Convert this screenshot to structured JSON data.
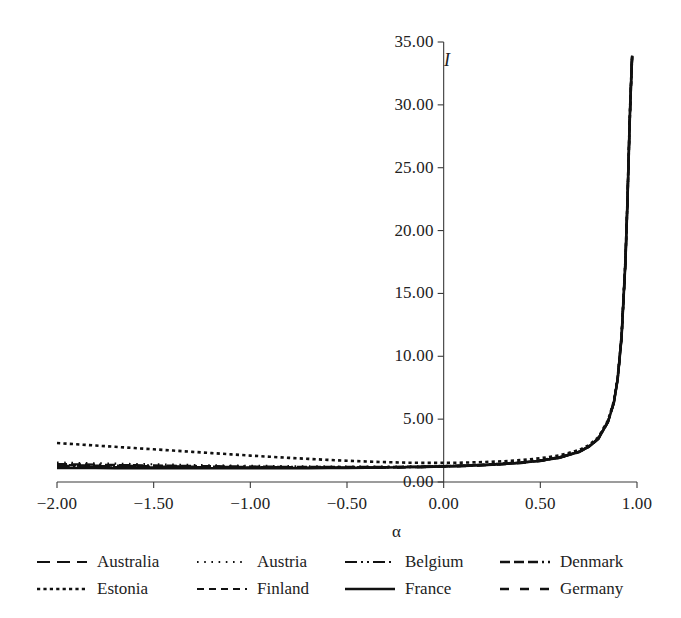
{
  "chart_data": {
    "type": "line",
    "title": "",
    "subtitle": "",
    "xlabel": "α",
    "ylabel": "I",
    "xlim": [
      -2.0,
      1.0
    ],
    "ylim": [
      0.0,
      35.0
    ],
    "grid": false,
    "legend_position": "bottom",
    "legend_columns": 4,
    "xticks": [
      "-2.00",
      "-1.50",
      "-1.00",
      "-0.50",
      "0.00",
      "0.50",
      "1.00"
    ],
    "xtick_values": [
      -2.0,
      -1.5,
      -1.0,
      -0.5,
      0.0,
      0.5,
      1.0
    ],
    "yticks": [
      "0.00",
      "5.00",
      "10.00",
      "15.00",
      "20.00",
      "25.00",
      "30.00",
      "35.00"
    ],
    "ytick_values": [
      0,
      5,
      10,
      15,
      20,
      25,
      30,
      35
    ],
    "x": [
      -2.0,
      -1.9,
      -1.8,
      -1.7,
      -1.6,
      -1.5,
      -1.4,
      -1.3,
      -1.2,
      -1.1,
      -1.0,
      -0.9,
      -0.8,
      -0.7,
      -0.6,
      -0.5,
      -0.4,
      -0.3,
      -0.2,
      -0.1,
      0.0,
      0.1,
      0.2,
      0.3,
      0.4,
      0.5,
      0.6,
      0.7,
      0.75,
      0.8,
      0.85,
      0.88,
      0.9,
      0.92,
      0.94,
      0.95,
      0.96,
      0.965,
      0.97,
      0.973,
      0.975
    ],
    "series": [
      {
        "name": "Australia",
        "dash": "long-dash",
        "dasharray": "13,7",
        "width": 2.1,
        "values": [
          1.3,
          1.29,
          1.27,
          1.26,
          1.24,
          1.23,
          1.22,
          1.2,
          1.19,
          1.18,
          1.17,
          1.16,
          1.16,
          1.15,
          1.15,
          1.15,
          1.16,
          1.17,
          1.19,
          1.21,
          1.25,
          1.29,
          1.35,
          1.43,
          1.54,
          1.7,
          1.95,
          2.4,
          2.8,
          3.45,
          4.8,
          6.3,
          8.2,
          11.5,
          17.5,
          22.0,
          27.5,
          30.0,
          32.0,
          33.2,
          33.9
        ]
      },
      {
        "name": "Austria",
        "dash": "sparse-dot",
        "dasharray": "1.6,5.6",
        "width": 2.1,
        "values": [
          1.55,
          1.52,
          1.49,
          1.46,
          1.43,
          1.41,
          1.38,
          1.36,
          1.33,
          1.31,
          1.29,
          1.28,
          1.26,
          1.25,
          1.24,
          1.23,
          1.23,
          1.23,
          1.24,
          1.26,
          1.29,
          1.33,
          1.39,
          1.47,
          1.58,
          1.74,
          1.99,
          2.44,
          2.84,
          3.49,
          4.84,
          6.34,
          8.24,
          11.54,
          17.54,
          22.04,
          27.54,
          30.04,
          32.04,
          33.24,
          33.94
        ]
      },
      {
        "name": "Belgium",
        "dash": "dash-dot-dot",
        "dasharray": "12,4,2,4,2,4",
        "width": 2.1,
        "values": [
          1.22,
          1.21,
          1.2,
          1.19,
          1.18,
          1.17,
          1.16,
          1.15,
          1.14,
          1.14,
          1.13,
          1.13,
          1.13,
          1.13,
          1.13,
          1.13,
          1.14,
          1.15,
          1.17,
          1.19,
          1.23,
          1.27,
          1.33,
          1.41,
          1.52,
          1.68,
          1.93,
          2.38,
          2.78,
          3.43,
          4.78,
          6.28,
          8.18,
          11.48,
          17.48,
          21.98,
          27.48,
          29.98,
          31.98,
          33.18,
          33.88
        ]
      },
      {
        "name": "Denmark",
        "dash": "dash-dash-dot",
        "dasharray": "10,4,10,4,10,4,2,4",
        "width": 2.4,
        "values": [
          1.42,
          1.4,
          1.38,
          1.35,
          1.33,
          1.31,
          1.29,
          1.27,
          1.25,
          1.24,
          1.22,
          1.21,
          1.2,
          1.19,
          1.19,
          1.19,
          1.19,
          1.2,
          1.21,
          1.23,
          1.26,
          1.31,
          1.37,
          1.45,
          1.56,
          1.72,
          1.97,
          2.42,
          2.82,
          3.47,
          4.82,
          6.32,
          8.22,
          11.52,
          17.52,
          22.02,
          27.52,
          30.02,
          32.02,
          33.22,
          33.92
        ]
      },
      {
        "name": "Estonia",
        "dash": "fine-dot",
        "dasharray": "3.2,3.2",
        "width": 2.6,
        "values": [
          3.1,
          3.0,
          2.9,
          2.8,
          2.7,
          2.6,
          2.5,
          2.4,
          2.3,
          2.2,
          2.1,
          2.01,
          1.92,
          1.84,
          1.76,
          1.69,
          1.63,
          1.58,
          1.54,
          1.52,
          1.52,
          1.54,
          1.58,
          1.64,
          1.74,
          1.89,
          2.12,
          2.54,
          2.92,
          3.56,
          4.9,
          6.4,
          8.28,
          11.58,
          17.58,
          22.08,
          27.58,
          30.08,
          32.08,
          33.28,
          33.96
        ]
      },
      {
        "name": "Finland",
        "dash": "short-dash",
        "dasharray": "7,5",
        "width": 2.2,
        "values": [
          1.35,
          1.33,
          1.31,
          1.3,
          1.28,
          1.26,
          1.25,
          1.23,
          1.22,
          1.21,
          1.2,
          1.19,
          1.18,
          1.17,
          1.17,
          1.17,
          1.17,
          1.18,
          1.2,
          1.22,
          1.25,
          1.3,
          1.36,
          1.44,
          1.55,
          1.71,
          1.96,
          2.41,
          2.81,
          3.46,
          4.81,
          6.31,
          8.21,
          11.51,
          17.51,
          22.01,
          27.51,
          30.01,
          32.01,
          33.21,
          33.91
        ]
      },
      {
        "name": "France",
        "dash": "solid",
        "dasharray": "",
        "width": 2.6,
        "values": [
          1.12,
          1.11,
          1.11,
          1.1,
          1.1,
          1.09,
          1.09,
          1.09,
          1.09,
          1.09,
          1.09,
          1.09,
          1.1,
          1.1,
          1.11,
          1.12,
          1.13,
          1.15,
          1.17,
          1.2,
          1.24,
          1.28,
          1.34,
          1.42,
          1.53,
          1.69,
          1.94,
          2.39,
          2.79,
          3.44,
          4.79,
          6.29,
          8.19,
          11.49,
          17.49,
          21.99,
          27.49,
          29.99,
          31.99,
          33.19,
          33.9
        ]
      },
      {
        "name": "Germany",
        "dash": "spaced-dash",
        "dasharray": "9,11",
        "width": 2.3,
        "values": [
          1.18,
          1.17,
          1.17,
          1.16,
          1.15,
          1.15,
          1.14,
          1.13,
          1.13,
          1.12,
          1.12,
          1.12,
          1.12,
          1.12,
          1.12,
          1.13,
          1.13,
          1.14,
          1.16,
          1.18,
          1.22,
          1.26,
          1.32,
          1.4,
          1.51,
          1.67,
          1.92,
          2.37,
          2.77,
          3.42,
          4.77,
          6.27,
          8.17,
          11.47,
          17.47,
          21.97,
          27.47,
          29.97,
          31.97,
          33.17,
          33.87
        ]
      }
    ]
  },
  "legend": {
    "rows": [
      [
        {
          "label": "Australia",
          "swatch": "long-dash"
        },
        {
          "label": "Austria",
          "swatch": "sparse-dot"
        },
        {
          "label": "Belgium",
          "swatch": "dash-dot-dot"
        },
        {
          "label": "Denmark",
          "swatch": "dash-dash-dot"
        }
      ],
      [
        {
          "label": "Estonia",
          "swatch": "fine-dot"
        },
        {
          "label": "Finland",
          "swatch": "short-dash"
        },
        {
          "label": "France",
          "swatch": "solid"
        },
        {
          "label": "Germany",
          "swatch": "spaced-dash"
        }
      ]
    ]
  },
  "colors": {
    "line": "#111111",
    "axis": "#3a3a3a",
    "text": "#222222",
    "background": "#ffffff"
  }
}
